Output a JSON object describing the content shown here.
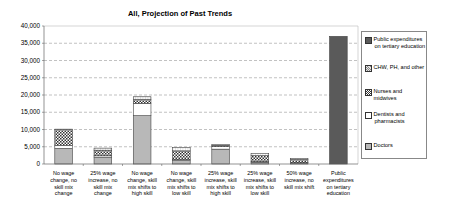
{
  "chart_data": {
    "type": "bar",
    "stacked": true,
    "title": "All, Projection of Past Trends",
    "xlabel": "",
    "ylabel": "",
    "ylim": [
      0,
      40000
    ],
    "yticks": [
      "0",
      "5,000",
      "10,000",
      "15,000",
      "20,000",
      "25,000",
      "30,000",
      "35,000",
      "40,000"
    ],
    "grid": "horizontal dashed",
    "legend_position": "right",
    "categories": [
      "No wage change, no skill mix change",
      "25% wage increase, no skill mix change",
      "No wage change, skill mix shifts to high skill",
      "No wage change, skill mix shifts to low skill",
      "25% wage increase, skill mix shifts to high skill",
      "25% wage increase, skill mix shifts to low skill",
      "50% wage increase, no skill mix shift",
      "Public expenditures on tertiary education"
    ],
    "series": [
      {
        "name": "Doctors",
        "values": [
          4500,
          2000,
          14000,
          1000,
          4300,
          500,
          300,
          0
        ]
      },
      {
        "name": "Dentists and pharmacists",
        "values": [
          800,
          400,
          3500,
          300,
          800,
          200,
          100,
          0
        ]
      },
      {
        "name": "Nurses and midwives",
        "values": [
          4700,
          1600,
          1200,
          2500,
          300,
          1700,
          900,
          0
        ]
      },
      {
        "name": "CHW, PH, and other",
        "values": [
          100,
          600,
          800,
          1000,
          200,
          600,
          300,
          0
        ]
      },
      {
        "name": "Public expenditures on tertiary education",
        "values": [
          0,
          0,
          0,
          0,
          0,
          0,
          0,
          37000
        ]
      }
    ]
  },
  "title": "All, Projection of Past Trends",
  "x_labels": [
    [
      "No wage",
      "change, no",
      "skill mix",
      "change"
    ],
    [
      "25% wage",
      "increase, no",
      "skill mix",
      "change"
    ],
    [
      "No wage",
      "change, skill",
      "mix shifts to",
      "high skill"
    ],
    [
      "No wage",
      "change, skill",
      "mix shifts to",
      "low skill"
    ],
    [
      "25% wage",
      "increase, skill",
      "mix shifts to",
      "high skill"
    ],
    [
      "25% wage",
      "increase, skill",
      "mix shifts to",
      "low skill"
    ],
    [
      "50% wage",
      "increase, no",
      "skill mix shift"
    ],
    [
      "Public",
      "expenditures",
      "on tertiary",
      "education"
    ]
  ],
  "legend": [
    {
      "label_lines": [
        "Public expenditures",
        "on tertiary education"
      ],
      "color": "#5a5a5a"
    },
    {
      "label_lines": [
        "CHW, PH, and other"
      ],
      "color": "#c8c8c8"
    },
    {
      "label_lines": [
        "Nurses and midwives"
      ],
      "color": "#3a3a3a"
    },
    {
      "label_lines": [
        "Dentists and",
        "pharmacists"
      ],
      "color": "#ffffff"
    },
    {
      "label_lines": [
        "Doctors"
      ],
      "color": "#b8b8b8"
    }
  ]
}
